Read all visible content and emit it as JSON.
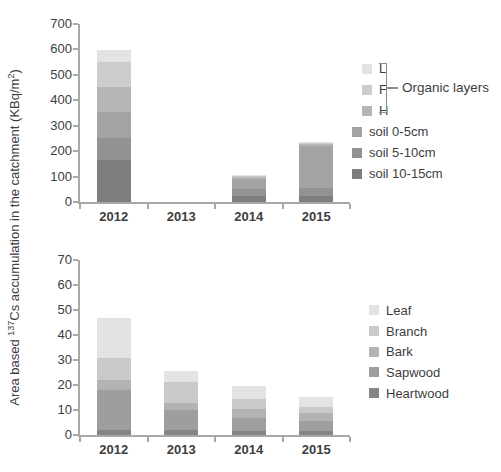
{
  "figure": {
    "background": "#ffffff",
    "axis_color": "#a8a8a8",
    "text_color": "#3d3d3d"
  },
  "ylabel": {
    "prefix": "Area based ",
    "sup1": "137",
    "mid": "Cs accumulation in the catchment (KBq/m",
    "sup2": "2",
    "suffix": ")"
  },
  "chart_data": [
    {
      "type": "bar",
      "stacked": true,
      "title": "",
      "xlabel": "",
      "ylabel": "Area based 137Cs accumulation in the catchment (KBq/m2)",
      "ylim": [
        0,
        700
      ],
      "ytick_step": 100,
      "grid": false,
      "categories": [
        "2012",
        "2013",
        "2014",
        "2015"
      ],
      "series": [
        {
          "name": "soil 10-15cm",
          "color": "#7e7e7e",
          "values": [
            166,
            0,
            22,
            25
          ]
        },
        {
          "name": "soil 5-10cm",
          "color": "#929292",
          "values": [
            85,
            0,
            28,
            31
          ]
        },
        {
          "name": "soil 0-5cm",
          "color": "#a3a3a3",
          "values": [
            104,
            0,
            40,
            165
          ]
        },
        {
          "name": "H",
          "color": "#b6b6b6",
          "values": [
            98,
            0,
            8,
            6
          ]
        },
        {
          "name": "F",
          "color": "#cccccc",
          "values": [
            97,
            0,
            6,
            5
          ]
        },
        {
          "name": "L",
          "color": "#e3e3e3",
          "values": [
            46,
            0,
            4,
            3
          ]
        }
      ],
      "totals": [
        596,
        0,
        108,
        235
      ],
      "legend_position": "right",
      "legend_order": [
        "L",
        "F",
        "H",
        "soil 0-5cm",
        "soil 5-10cm",
        "soil 10-15cm"
      ],
      "legend_group_label": "Organic layers",
      "legend_group_items": [
        "L",
        "F",
        "H"
      ]
    },
    {
      "type": "bar",
      "stacked": true,
      "title": "",
      "xlabel": "",
      "ylabel": "Area based 137Cs accumulation in the catchment (KBq/m2)",
      "ylim": [
        0,
        70
      ],
      "ytick_step": 10,
      "grid": false,
      "categories": [
        "2012",
        "2013",
        "2014",
        "2015"
      ],
      "series": [
        {
          "name": "Heartwood",
          "color": "#858585",
          "values": [
            2,
            2.2,
            1.7,
            1.7
          ]
        },
        {
          "name": "Sapwood",
          "color": "#9e9e9e",
          "values": [
            16,
            7.8,
            5,
            4
          ]
        },
        {
          "name": "Bark",
          "color": "#b3b3b3",
          "values": [
            4,
            3,
            3.8,
            3.3
          ]
        },
        {
          "name": "Branch",
          "color": "#c9c9c9",
          "values": [
            9,
            8.2,
            4.1,
            2.1
          ]
        },
        {
          "name": "Leaf",
          "color": "#e3e3e3",
          "values": [
            16,
            4.4,
            5,
            4.3
          ]
        }
      ],
      "totals": [
        47,
        25.6,
        19.6,
        15.4
      ],
      "legend_position": "right",
      "legend_order": [
        "Leaf",
        "Branch",
        "Bark",
        "Sapwood",
        "Heartwood"
      ]
    }
  ]
}
